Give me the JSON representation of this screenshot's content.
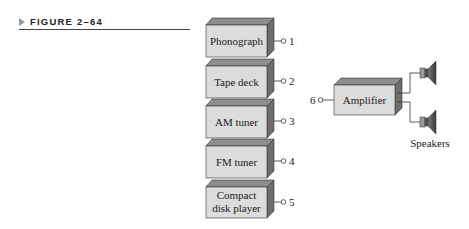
{
  "figure": {
    "label": "FIGURE 2–64"
  },
  "colors": {
    "front_face": "#dcdcdc",
    "top_face": "#8e8e8e",
    "side_face": "#6e6e6e",
    "speaker": "#5a5a5a",
    "line": "#333333"
  },
  "sources": [
    {
      "lines": [
        "Phonograph"
      ],
      "terminal": "1"
    },
    {
      "lines": [
        "Tape deck"
      ],
      "terminal": "2"
    },
    {
      "lines": [
        "AM tuner"
      ],
      "terminal": "3"
    },
    {
      "lines": [
        "FM tuner"
      ],
      "terminal": "4"
    },
    {
      "lines": [
        "Compact",
        "disk player"
      ],
      "terminal": "5"
    }
  ],
  "amplifier": {
    "label": "Amplifier",
    "input_terminal": "6"
  },
  "speakers": {
    "label": "Speakers",
    "count": 2
  }
}
